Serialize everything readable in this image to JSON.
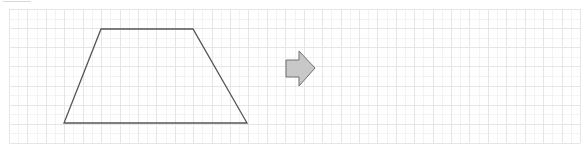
{
  "diagram": {
    "type": "geometry-grid-transformation",
    "grid": {
      "left": 9,
      "top": 9,
      "right": 580,
      "bottom": 143,
      "columns": 31,
      "rows": 7,
      "line_color": "#e6e6e6",
      "subline_color": "#f3f3f3"
    },
    "shapes": [
      {
        "name": "trapezoid",
        "points": [
          [
            101,
            29
          ],
          [
            193,
            29
          ],
          [
            247,
            123
          ],
          [
            64,
            123
          ]
        ],
        "stroke": "#555555",
        "fill": "none"
      }
    ],
    "arrow": {
      "name": "right-arrow",
      "direction": "right",
      "points": [
        [
          286,
          60
        ],
        [
          299,
          60
        ],
        [
          299,
          51
        ],
        [
          315,
          68
        ],
        [
          299,
          86
        ],
        [
          299,
          77
        ],
        [
          286,
          77
        ]
      ],
      "fill": "#c8c8c8",
      "stroke": "#707070"
    }
  }
}
